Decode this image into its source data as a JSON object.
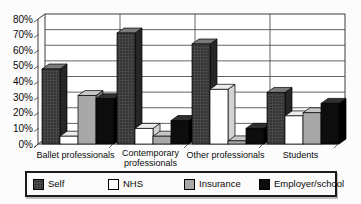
{
  "chart_data": {
    "type": "bar",
    "style": "3d-column",
    "title": "",
    "categories": [
      "Ballet professionals",
      "Contemporary\nprofessionals",
      "Other professionals",
      "Students"
    ],
    "series": [
      {
        "name": "Self",
        "color": "#474747",
        "color_top": "#7a7a7a",
        "color_side": "#262626",
        "texture": "dots",
        "texture_dot_color": "#181818",
        "values": [
          48,
          71,
          64,
          33
        ]
      },
      {
        "name": "NHS",
        "color": "#ffffff",
        "color_top": "#ececec",
        "color_side": "#d2d2d2",
        "values": [
          5,
          10,
          35,
          18
        ]
      },
      {
        "name": "Insurance",
        "color": "#a8a8a8",
        "color_top": "#c6c6c6",
        "color_side": "#7e7e7e",
        "values": [
          31,
          5,
          2,
          20
        ]
      },
      {
        "name": "Employer/school",
        "color": "#0d0d0d",
        "color_top": "#2f2f2f",
        "color_side": "#000000",
        "values": [
          29,
          15,
          10,
          26
        ]
      }
    ],
    "ylim": [
      0,
      80
    ],
    "ytick_step": 10,
    "yticks": [
      "0%",
      "10%",
      "20%",
      "30%",
      "40%",
      "50%",
      "60%",
      "70%",
      "80%"
    ],
    "grid": true,
    "legend_position": "bottom"
  },
  "legend": {
    "items": [
      "Self",
      "NHS",
      "Insurance",
      "Employer/school"
    ]
  }
}
